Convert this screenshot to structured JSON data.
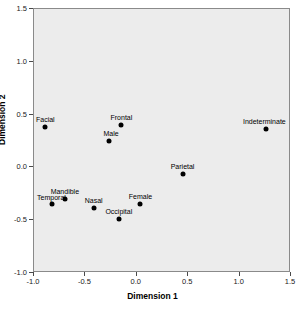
{
  "chart_data": {
    "type": "scatter",
    "title": "",
    "xlabel": "Dimension 1",
    "ylabel": "Dimension 2",
    "xlim": [
      -1.0,
      1.5
    ],
    "ylim": [
      -1.0,
      1.5
    ],
    "xticks": [
      "-1.0",
      "-0.5",
      "0.0",
      "0.5",
      "1.0",
      "1.5"
    ],
    "xtick_values": [
      -1.0,
      -0.5,
      0.0,
      0.5,
      1.0,
      1.5
    ],
    "yticks": [
      "-1.0",
      "-0.5",
      "0.0",
      "0.5",
      "1.0",
      "1.5"
    ],
    "ytick_values": [
      -1.0,
      -0.5,
      0.0,
      0.5,
      1.0,
      1.5
    ],
    "grid": false,
    "legend": false,
    "points": [
      {
        "label": "Facial",
        "x": -0.88,
        "y": 0.37,
        "label_dx": 0,
        "label_dy": -4
      },
      {
        "label": "Frontal",
        "x": -0.14,
        "y": 0.39,
        "label_dx": 0,
        "label_dy": -4
      },
      {
        "label": "Male",
        "x": -0.26,
        "y": 0.24,
        "label_dx": 2,
        "label_dy": -4
      },
      {
        "label": "Indeterminate",
        "x": 1.27,
        "y": 0.355,
        "label_dx": -2,
        "label_dy": -4
      },
      {
        "label": "Parietal",
        "x": 0.455,
        "y": -0.07,
        "label_dx": 0,
        "label_dy": -4
      },
      {
        "label": "Mandible",
        "x": -0.69,
        "y": -0.31,
        "label_dx": 0,
        "label_dy": -4
      },
      {
        "label": "Temporal",
        "x": -0.82,
        "y": -0.36,
        "label_dx": 0,
        "label_dy": -3
      },
      {
        "label": "Nasal",
        "x": -0.41,
        "y": -0.39,
        "label_dx": 0,
        "label_dy": -4
      },
      {
        "label": "Female",
        "x": 0.045,
        "y": -0.355,
        "label_dx": 0,
        "label_dy": -4
      },
      {
        "label": "Occipital",
        "x": -0.165,
        "y": -0.5,
        "label_dx": 0,
        "label_dy": -4
      }
    ]
  }
}
